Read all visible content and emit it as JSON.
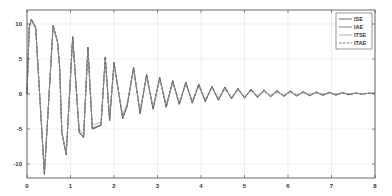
{
  "chart_data": {
    "type": "line",
    "title": "",
    "xlabel": "",
    "ylabel": "",
    "xlim": [
      0,
      8
    ],
    "ylim": [
      -12,
      12
    ],
    "grid": true,
    "legend_position": "upper right",
    "xticks": [
      0,
      1,
      2,
      3,
      4,
      5,
      6,
      7,
      8
    ],
    "yticks": [
      -10,
      -5,
      0,
      5,
      10
    ],
    "x": [
      0,
      0.05,
      0.1,
      0.2,
      0.4,
      0.6,
      0.7,
      0.75,
      0.8,
      0.9,
      1.05,
      1.2,
      1.3,
      1.4,
      1.5,
      1.7,
      1.8,
      1.9,
      2.0,
      2.2,
      2.3,
      2.45,
      2.6,
      2.75,
      2.9,
      3.05,
      3.2,
      3.35,
      3.5,
      3.65,
      3.8,
      3.95,
      4.1,
      4.25,
      4.4,
      4.55,
      4.7,
      4.85,
      5.0,
      5.15,
      5.3,
      5.45,
      5.6,
      5.75,
      5.9,
      6.05,
      6.2,
      6.35,
      6.5,
      6.65,
      6.8,
      6.95,
      7.1,
      7.25,
      7.4,
      7.55,
      7.7,
      7.85,
      8.0
    ],
    "series": [
      {
        "name": "ISE",
        "style": "solid",
        "color": "#555555",
        "values": [
          0,
          9.5,
          10.7,
          9.5,
          -11.5,
          9.8,
          7.5,
          4,
          -5.5,
          -8.7,
          8.2,
          -5.5,
          -6.2,
          6.7,
          -5,
          -4.5,
          5.3,
          -3.8,
          4.5,
          -3.5,
          -1.8,
          3.8,
          -2.8,
          2.8,
          -2.2,
          2.4,
          -1.9,
          1.9,
          -1.5,
          1.7,
          -1.3,
          1.4,
          -1.1,
          1.1,
          -0.9,
          1.0,
          -0.7,
          0.8,
          -0.6,
          0.7,
          -0.5,
          0.6,
          -0.4,
          0.5,
          -0.35,
          0.45,
          -0.3,
          0.35,
          -0.25,
          0.3,
          -0.2,
          0.25,
          -0.15,
          0.2,
          -0.1,
          0.15,
          0.0,
          0.1,
          0.1
        ]
      },
      {
        "name": "IAE",
        "style": "solid",
        "color": "#777777",
        "values": [
          0,
          9.4,
          10.6,
          9.4,
          -11.4,
          9.7,
          7.4,
          3.9,
          -5.4,
          -8.6,
          8.1,
          -5.4,
          -6.1,
          6.6,
          -4.9,
          -4.4,
          5.2,
          -3.7,
          4.4,
          -3.4,
          -1.7,
          3.7,
          -2.7,
          2.7,
          -2.1,
          2.3,
          -1.8,
          1.8,
          -1.4,
          1.6,
          -1.2,
          1.3,
          -1.0,
          1.0,
          -0.8,
          0.9,
          -0.6,
          0.7,
          -0.5,
          0.6,
          -0.4,
          0.5,
          -0.35,
          0.45,
          -0.3,
          0.4,
          -0.25,
          0.3,
          -0.2,
          0.25,
          -0.15,
          0.2,
          -0.1,
          0.15,
          -0.05,
          0.1,
          0.0,
          0.1,
          0.1
        ]
      },
      {
        "name": "ITSE",
        "style": "solid",
        "color": "#aaaaaa",
        "values": [
          0,
          9.3,
          10.5,
          9.3,
          -11.3,
          9.6,
          7.3,
          3.8,
          -5.3,
          -8.5,
          7.8,
          -5.0,
          -5.8,
          6.3,
          -4.5,
          -4.0,
          4.9,
          -3.3,
          4.1,
          -3.0,
          -1.4,
          3.4,
          -2.3,
          2.4,
          -1.7,
          2.0,
          -1.4,
          1.5,
          -1.1,
          1.3,
          -0.9,
          1.0,
          -0.7,
          0.8,
          -0.5,
          0.6,
          -0.4,
          0.5,
          -0.3,
          0.4,
          -0.2,
          0.3,
          -0.15,
          0.25,
          -0.1,
          0.2,
          -0.05,
          0.15,
          0.0,
          0.1,
          0.0,
          0.1,
          0.05,
          0.1,
          0.05,
          0.1,
          0.05,
          0.1,
          0.1
        ]
      },
      {
        "name": "ITAE",
        "style": "dashed",
        "color": "#666666",
        "values": [
          0,
          9.5,
          10.7,
          9.5,
          -11.5,
          9.8,
          7.5,
          4,
          -5.5,
          -8.7,
          8.2,
          -5.5,
          -6.2,
          6.7,
          -5,
          -4.5,
          5.3,
          -3.8,
          4.5,
          -3.5,
          -1.8,
          3.8,
          -2.8,
          2.8,
          -2.2,
          2.4,
          -1.9,
          1.9,
          -1.5,
          1.7,
          -1.3,
          1.4,
          -1.1,
          1.1,
          -0.9,
          1.0,
          -0.7,
          0.8,
          -0.6,
          0.7,
          -0.5,
          0.6,
          -0.4,
          0.5,
          -0.35,
          0.45,
          -0.3,
          0.35,
          -0.25,
          0.3,
          -0.2,
          0.25,
          -0.15,
          0.2,
          -0.1,
          0.15,
          0.0,
          0.1,
          0.1
        ]
      }
    ]
  },
  "legend": {
    "items": [
      {
        "label": "ISE"
      },
      {
        "label": "IAE"
      },
      {
        "label": "ITSE"
      },
      {
        "label": "ITAE"
      }
    ]
  },
  "colors": {
    "axis": "#444444",
    "grid": "#e6e6e6",
    "background": "#ffffff"
  }
}
